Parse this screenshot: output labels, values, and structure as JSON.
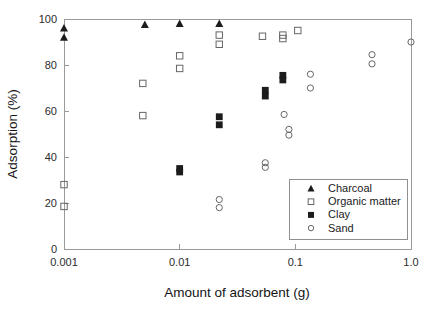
{
  "chart_data": {
    "type": "scatter",
    "title": "",
    "xlabel": "Amount of adsorbent (g)",
    "ylabel": "Adsorption (%)",
    "xscale": "log",
    "yscale": "linear",
    "xlim": [
      0.001,
      1.0
    ],
    "ylim": [
      0,
      100
    ],
    "xticks": [
      0.001,
      0.01,
      0.1,
      1.0
    ],
    "xtick_labels": [
      "0.001",
      "0.01",
      "0.1",
      "1.0"
    ],
    "yticks": [
      0,
      20,
      40,
      60,
      80,
      100
    ],
    "ytick_labels": [
      "0",
      "20",
      "40",
      "60",
      "80",
      "100"
    ],
    "grid": false,
    "legend_position": "lower right",
    "series": [
      {
        "name": "Charcoal",
        "marker": "filled-triangle",
        "color": "#1c1c1c",
        "points": [
          {
            "x": 0.001,
            "y": 96.0
          },
          {
            "x": 0.001,
            "y": 92.0
          },
          {
            "x": 0.005,
            "y": 97.5
          },
          {
            "x": 0.01,
            "y": 98.0
          },
          {
            "x": 0.022,
            "y": 98.0
          }
        ]
      },
      {
        "name": "Organic matter",
        "marker": "open-square",
        "color": "#666666",
        "points": [
          {
            "x": 0.001,
            "y": 28.0
          },
          {
            "x": 0.001,
            "y": 18.5
          },
          {
            "x": 0.0048,
            "y": 72.0
          },
          {
            "x": 0.0048,
            "y": 58.0
          },
          {
            "x": 0.01,
            "y": 84.0
          },
          {
            "x": 0.01,
            "y": 78.5
          },
          {
            "x": 0.022,
            "y": 93.0
          },
          {
            "x": 0.022,
            "y": 89.0
          },
          {
            "x": 0.052,
            "y": 92.5
          },
          {
            "x": 0.078,
            "y": 93.0
          },
          {
            "x": 0.078,
            "y": 91.5
          },
          {
            "x": 0.105,
            "y": 95.0
          }
        ]
      },
      {
        "name": "Clay",
        "marker": "filled-square",
        "color": "#1c1c1c",
        "points": [
          {
            "x": 0.01,
            "y": 35.0
          },
          {
            "x": 0.01,
            "y": 33.5
          },
          {
            "x": 0.022,
            "y": 57.5
          },
          {
            "x": 0.022,
            "y": 54.0
          },
          {
            "x": 0.055,
            "y": 69.0
          },
          {
            "x": 0.055,
            "y": 66.5
          },
          {
            "x": 0.078,
            "y": 75.5
          },
          {
            "x": 0.078,
            "y": 73.5
          }
        ]
      },
      {
        "name": "Sand",
        "marker": "open-circle",
        "color": "#888888",
        "points": [
          {
            "x": 0.022,
            "y": 21.5
          },
          {
            "x": 0.022,
            "y": 18.0
          },
          {
            "x": 0.055,
            "y": 37.5
          },
          {
            "x": 0.055,
            "y": 35.5
          },
          {
            "x": 0.08,
            "y": 58.5
          },
          {
            "x": 0.088,
            "y": 52.0
          },
          {
            "x": 0.088,
            "y": 49.5
          },
          {
            "x": 0.135,
            "y": 76.0
          },
          {
            "x": 0.135,
            "y": 70.0
          },
          {
            "x": 0.46,
            "y": 84.5
          },
          {
            "x": 0.46,
            "y": 80.5
          },
          {
            "x": 1.0,
            "y": 90.0
          }
        ]
      }
    ],
    "legend_entries": [
      {
        "label": "Charcoal",
        "marker": "filled-triangle"
      },
      {
        "label": "Organic matter",
        "marker": "open-square"
      },
      {
        "label": "Clay",
        "marker": "filled-square"
      },
      {
        "label": "Sand",
        "marker": "open-circle"
      }
    ]
  }
}
